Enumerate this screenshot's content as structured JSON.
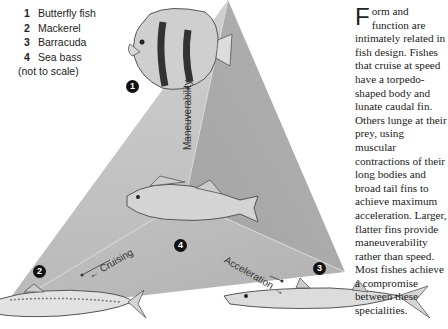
{
  "legend": {
    "items": [
      {
        "num": "1",
        "label": "Butterfly fish"
      },
      {
        "num": "2",
        "label": "Mackerel"
      },
      {
        "num": "3",
        "label": "Barracuda"
      },
      {
        "num": "4",
        "label": "Sea bass"
      }
    ],
    "note": "(not to scale)"
  },
  "diagram": {
    "axes": {
      "maneuverability": "Maneuverability →",
      "cruising": "← Cruising",
      "acceleration": "Acceleration →"
    },
    "markers": [
      "1",
      "2",
      "3",
      "4"
    ],
    "colors": {
      "triangle_light": "#c8c8c8",
      "triangle_mid": "#b5b5b5",
      "triangle_dark": "#a8a8a8",
      "marker": "#111111"
    }
  },
  "text": {
    "dropcap": "F",
    "body": "orm and function are intimately related in fish design. Fishes that cruise at speed have a torpedo-shaped body and lunate caudal fin. Others lunge at their prey, using muscular contractions of their long bodies and broad tail fins to achieve maximum acceleration. Larger, flatter fins provide maneuverability rather than speed. Most fishes achieve a compromise between these specialities."
  }
}
